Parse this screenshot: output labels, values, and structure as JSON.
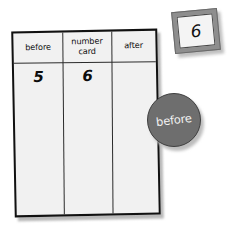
{
  "worksheet": {
    "table": {
      "headers": [
        "before",
        "number card",
        "after"
      ],
      "values": [
        "5",
        "6",
        ""
      ]
    },
    "number_card": {
      "value": "6"
    },
    "token": {
      "label": "before"
    },
    "colors": {
      "board_fill": "#f1f1f1",
      "board_border": "#111111",
      "grid_line": "#2b2b2b",
      "token_fill": "#6e6e6e",
      "token_border": "#3f3f3f",
      "token_text": "#f2f2f2",
      "card_frame": "#8e8e8e",
      "card_fill": "#f4f4f4",
      "shadow": "#bdbdbd",
      "background": "#ffffff"
    }
  }
}
